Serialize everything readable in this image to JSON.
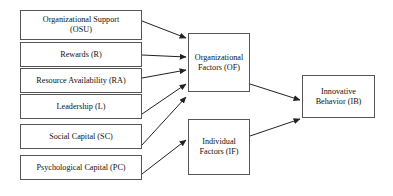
{
  "diagram": {
    "type": "path-diagram",
    "background_color": "#ffffff",
    "box_border_color": "#555555",
    "arrow_color": "#222222",
    "nodes": {
      "osu": {
        "label": "Organizational Support\n(OSU)",
        "group": "antecedent"
      },
      "rewards": {
        "label": "Rewards (R)",
        "group": "antecedent"
      },
      "resource_availability": {
        "label": "Resource Availability (RA)",
        "group": "antecedent"
      },
      "leadership": {
        "label": "Leadership (L)",
        "group": "antecedent"
      },
      "social_capital": {
        "label": "Social Capital (SC)",
        "group": "antecedent"
      },
      "psychological_capital": {
        "label": "Psychological Capital (PC)",
        "group": "antecedent"
      },
      "organizational_factors": {
        "label": "Organizational\nFactors (OF)",
        "group": "mediator"
      },
      "individual_factors": {
        "label": "Individual\nFactors (IF)",
        "group": "mediator"
      },
      "innovative_behavior": {
        "label": "Innovative\nBehavior (IB)",
        "group": "outcome"
      }
    },
    "edges": [
      {
        "from": "osu",
        "to": "organizational_factors"
      },
      {
        "from": "rewards",
        "to": "organizational_factors"
      },
      {
        "from": "resource_availability",
        "to": "organizational_factors"
      },
      {
        "from": "leadership",
        "to": "organizational_factors"
      },
      {
        "from": "social_capital",
        "to": "individual_factors"
      },
      {
        "from": "psychological_capital",
        "to": "individual_factors"
      },
      {
        "from": "organizational_factors",
        "to": "innovative_behavior"
      },
      {
        "from": "individual_factors",
        "to": "innovative_behavior"
      }
    ]
  }
}
